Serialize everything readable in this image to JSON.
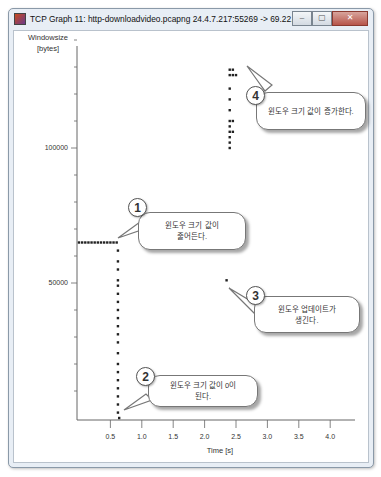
{
  "window": {
    "title": "TCP Graph 11: http-downloadvideo.pcapng 24.4.7.217:55269 -> 69.22.165.155:80",
    "controls": {
      "minimize": "–",
      "maximize": "▢",
      "close": "✕"
    }
  },
  "axes": {
    "y_label_line1": "Windowsize",
    "y_label_line2": "[bytes]",
    "y_ticks": {
      "t100000": "100000",
      "t50000": "50000"
    },
    "x_label": "Time [s]",
    "x_ticks": [
      "0.5",
      "1.0",
      "1.5",
      "2.0",
      "2.5",
      "3.0",
      "3.5",
      "4.0"
    ]
  },
  "callouts": [
    {
      "number": "1",
      "text_line1": "윈도우 크기 값이",
      "text_line2": "줄어든다."
    },
    {
      "number": "2",
      "text_line1": "윈도우 크기 값이 0이",
      "text_line2": "된다."
    },
    {
      "number": "3",
      "text_line1": "윈도우 업데이트가",
      "text_line2": "생긴다."
    },
    {
      "number": "4",
      "text_line1": "윈도우 크기 값이 증가한다.",
      "text_line2": ""
    }
  ],
  "chart_data": {
    "type": "scatter",
    "title": "TCP Graph 11: http-downloadvideo.pcapng 24.4.7.217:55269 -> 69.22.165.155:80",
    "xlabel": "Time [s]",
    "ylabel": "Windowsize [bytes]",
    "xlim": [
      0,
      4.3
    ],
    "ylim": [
      0,
      140000
    ],
    "x_ticks": [
      0.5,
      1.0,
      1.5,
      2.0,
      2.5,
      3.0,
      3.5,
      4.0
    ],
    "y_ticks_labeled": [
      50000,
      100000
    ],
    "y_minor_tick_step": 10000,
    "grid": false,
    "series": [
      {
        "name": "Window size",
        "points": [
          [
            0.0,
            65000
          ],
          [
            0.05,
            65000
          ],
          [
            0.1,
            65000
          ],
          [
            0.15,
            65000
          ],
          [
            0.2,
            65000
          ],
          [
            0.25,
            65000
          ],
          [
            0.3,
            65000
          ],
          [
            0.35,
            65000
          ],
          [
            0.4,
            65000
          ],
          [
            0.45,
            65000
          ],
          [
            0.5,
            65000
          ],
          [
            0.55,
            65000
          ],
          [
            0.6,
            65000
          ],
          [
            0.62,
            62000
          ],
          [
            0.62,
            58000
          ],
          [
            0.62,
            55000
          ],
          [
            0.62,
            51000
          ],
          [
            0.62,
            49000
          ],
          [
            0.62,
            46000
          ],
          [
            0.62,
            43000
          ],
          [
            0.62,
            40000
          ],
          [
            0.62,
            37000
          ],
          [
            0.62,
            34000
          ],
          [
            0.62,
            31000
          ],
          [
            0.62,
            28000
          ],
          [
            0.62,
            24000
          ],
          [
            0.62,
            20000
          ],
          [
            0.62,
            17000
          ],
          [
            0.62,
            14000
          ],
          [
            0.62,
            11000
          ],
          [
            0.62,
            8000
          ],
          [
            0.62,
            5000
          ],
          [
            0.62,
            2000
          ],
          [
            0.64,
            0
          ],
          [
            2.35,
            51000
          ],
          [
            2.4,
            100000
          ],
          [
            2.4,
            102000
          ],
          [
            2.4,
            104000
          ],
          [
            2.4,
            106000
          ],
          [
            2.4,
            108000
          ],
          [
            2.4,
            110000
          ],
          [
            2.45,
            106000
          ],
          [
            2.45,
            110000
          ],
          [
            2.4,
            114000
          ],
          [
            2.4,
            118000
          ],
          [
            2.4,
            122000
          ],
          [
            2.4,
            127000
          ],
          [
            2.45,
            127000
          ],
          [
            2.5,
            127000
          ],
          [
            2.4,
            129000
          ],
          [
            2.45,
            129000
          ]
        ]
      }
    ],
    "annotations": [
      {
        "id": 1,
        "text": "윈도우 크기 값이 줄어든다.",
        "target": [
          0.62,
          65000
        ]
      },
      {
        "id": 2,
        "text": "윈도우 크기 값이 0이 된다.",
        "target": [
          0.64,
          0
        ]
      },
      {
        "id": 3,
        "text": "윈도우 업데이트가 생긴다.",
        "target": [
          2.35,
          51000
        ]
      },
      {
        "id": 4,
        "text": "윈도우 크기 값이 증가한다.",
        "target": [
          2.5,
          129000
        ]
      }
    ]
  }
}
